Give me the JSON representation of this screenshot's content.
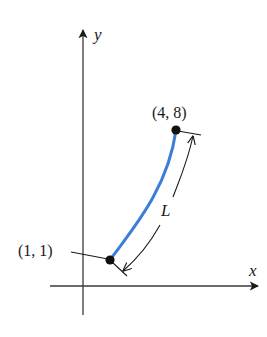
{
  "diagram": {
    "type": "arc-length-figure",
    "axes": {
      "x_label": "x",
      "y_label": "y"
    },
    "points": [
      {
        "id": "start",
        "label": "(1, 1)",
        "x": 1,
        "y": 1
      },
      {
        "id": "end",
        "label": "(4, 8)",
        "x": 4,
        "y": 8
      }
    ],
    "curve": {
      "description": "curve segment from (1, 1) to (4, 8)",
      "color": "#3a7fd5"
    },
    "dimension": {
      "label": "L",
      "meaning": "arc length of the curve"
    },
    "colors": {
      "ink": "#1a1a1a",
      "axis": "#3a3a3a",
      "curve": "#3a7fd5",
      "background": "#ffffff"
    }
  }
}
